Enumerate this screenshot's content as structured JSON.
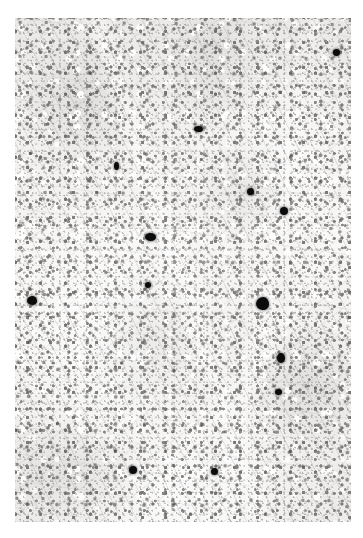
{
  "figure": {
    "kind": "photomicrograph",
    "caption": "",
    "page_background": "#ffffff",
    "plate": {
      "x": 15,
      "y": 18,
      "width": 336,
      "height": 504,
      "base_color": "#f3f2f1"
    }
  },
  "chart_data": {
    "type": "heatmap",
    "title": "",
    "subtitle": "",
    "xlabel": "",
    "ylabel": "",
    "grid": false,
    "legend_position": "none",
    "field_tone": {
      "background_light": "#f5f4f3",
      "background_mid": "#eceae9",
      "nucleus_dark": "#4a4846",
      "nucleus_mid": "#6b6866",
      "grain": "#8a8785",
      "vacuole": "#ffffff",
      "focus_black": "#0b0b0b"
    },
    "dark_foci": [
      {
        "id": "focus-1",
        "x_pct": 95.8,
        "y_pct": 6.8,
        "w": 7,
        "h": 7,
        "shape": "round",
        "halo": 0
      },
      {
        "id": "focus-2",
        "x_pct": 54.7,
        "y_pct": 22.1,
        "w": 9,
        "h": 6,
        "shape": "oval",
        "halo": 0
      },
      {
        "id": "focus-3",
        "x_pct": 30.3,
        "y_pct": 29.4,
        "w": 5,
        "h": 8,
        "shape": "oval",
        "halo": 11
      },
      {
        "id": "focus-4",
        "x_pct": 70.0,
        "y_pct": 34.5,
        "w": 7,
        "h": 7,
        "shape": "irregular",
        "halo": 0
      },
      {
        "id": "focus-5",
        "x_pct": 80.1,
        "y_pct": 38.3,
        "w": 8,
        "h": 8,
        "shape": "round",
        "halo": 0
      },
      {
        "id": "focus-6",
        "x_pct": 40.2,
        "y_pct": 43.5,
        "w": 11,
        "h": 8,
        "shape": "oval",
        "halo": 13
      },
      {
        "id": "focus-7",
        "x_pct": 39.6,
        "y_pct": 53.0,
        "w": 6,
        "h": 6,
        "shape": "round",
        "halo": 0
      },
      {
        "id": "focus-8",
        "x_pct": 5.1,
        "y_pct": 56.0,
        "w": 10,
        "h": 9,
        "shape": "irregular",
        "halo": 0
      },
      {
        "id": "focus-9",
        "x_pct": 73.8,
        "y_pct": 56.6,
        "w": 13,
        "h": 13,
        "shape": "irregular",
        "halo": 20
      },
      {
        "id": "focus-10",
        "x_pct": 79.2,
        "y_pct": 67.5,
        "w": 8,
        "h": 10,
        "shape": "oval",
        "halo": 0
      },
      {
        "id": "focus-11",
        "x_pct": 78.3,
        "y_pct": 74.2,
        "w": 7,
        "h": 6,
        "shape": "round",
        "halo": 0
      },
      {
        "id": "focus-12",
        "x_pct": 35.1,
        "y_pct": 89.6,
        "w": 8,
        "h": 8,
        "shape": "round",
        "halo": 12
      },
      {
        "id": "focus-13",
        "x_pct": 59.5,
        "y_pct": 90.0,
        "w": 7,
        "h": 7,
        "shape": "round",
        "halo": 0
      }
    ]
  }
}
